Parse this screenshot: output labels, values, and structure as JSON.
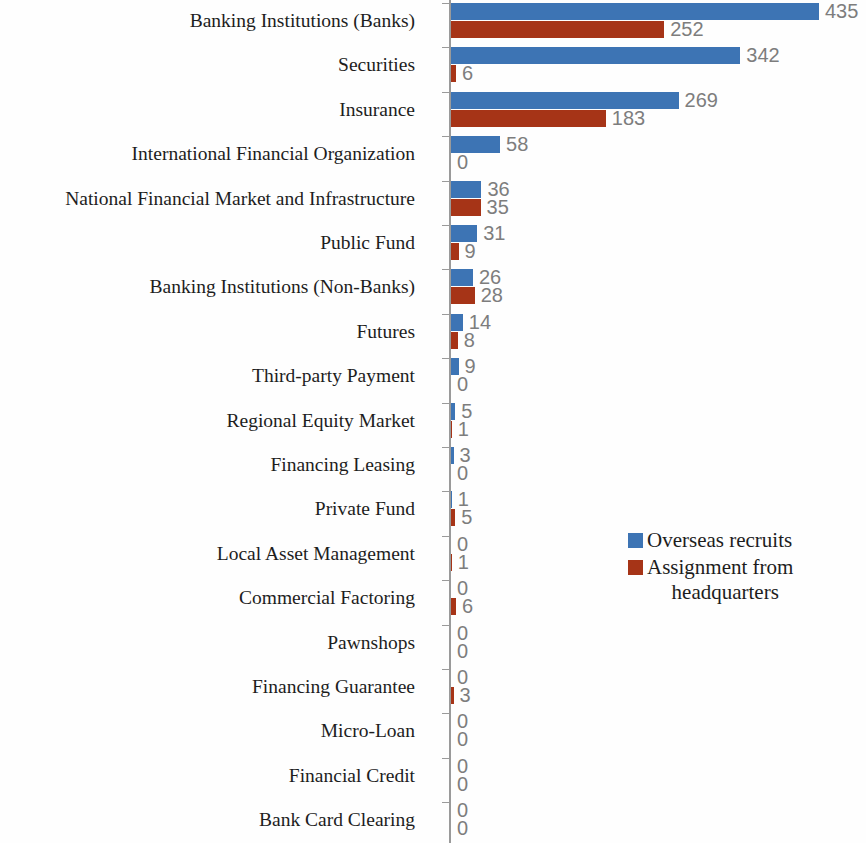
{
  "chart_data": {
    "type": "bar",
    "orientation": "horizontal",
    "title": "",
    "subtitle": "",
    "xlabel": "",
    "ylabel": "",
    "grid": false,
    "legend_position": "middle-right",
    "xlim": [
      0,
      435
    ],
    "value_labels_shown": true,
    "categories": [
      "Banking Institutions (Banks)",
      "Securities",
      "Insurance",
      "International Financial Organization",
      "National Financial Market and Infrastructure",
      "Public Fund",
      "Banking Institutions (Non-Banks)",
      "Futures",
      "Third-party Payment",
      "Regional Equity Market",
      "Financing Leasing",
      "Private Fund",
      "Local Asset Management",
      "Commercial Factoring",
      "Pawnshops",
      "Financing Guarantee",
      "Micro-Loan",
      "Financial Credit",
      "Bank Card Clearing"
    ],
    "series": [
      {
        "name": "Overseas recruits",
        "color": "#3d74b4",
        "values": [
          435,
          342,
          269,
          58,
          36,
          31,
          26,
          14,
          9,
          5,
          3,
          1,
          0,
          0,
          0,
          0,
          0,
          0,
          0
        ]
      },
      {
        "name": "Assignment from headquarters",
        "color": "#a63417",
        "values": [
          252,
          6,
          183,
          0,
          35,
          9,
          28,
          8,
          0,
          1,
          0,
          5,
          1,
          6,
          0,
          3,
          0,
          0,
          0
        ]
      }
    ]
  },
  "legend": {
    "items": [
      {
        "label": "Overseas recruits",
        "label_line2": "",
        "color": "#3d74b4"
      },
      {
        "label": "Assignment from",
        "label_line2": "headquarters",
        "color": "#a63417"
      }
    ]
  },
  "axis": {
    "line_color": "#9a9a9a",
    "value_label_color": "#7d7d7d",
    "category_label_color": "#1d1d1d"
  }
}
